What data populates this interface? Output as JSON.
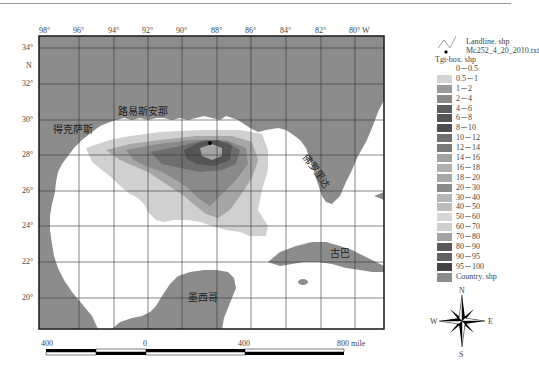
{
  "map": {
    "top_ticks": [
      "98°",
      "96°",
      "94°",
      "92°",
      "90°",
      "88°",
      "86°",
      "84°",
      "82°",
      "80° W"
    ],
    "left_ticks": [
      "34°",
      "N",
      "32°",
      "30°",
      "28°",
      "26°",
      "24°",
      "22°",
      "20°"
    ],
    "place_labels": {
      "louisiana": "路易斯安那",
      "texas": "得克萨斯",
      "florida": "佛罗里达",
      "cuba": "古巴",
      "mexico": "墨西哥"
    },
    "colors": {
      "land": "#8c8c8c",
      "water": "#ffffff",
      "frame": "#222222",
      "grid": "#333333"
    }
  },
  "legend": {
    "landline": "Landline. shp",
    "source_point": "Mc252_4_20_2010.txt",
    "tgt_box_title": "Tgt-box. shp",
    "classes": [
      {
        "label": "0－0.5",
        "color": "#ffffff"
      },
      {
        "label": "0.5－1",
        "color": "#d4d4d4"
      },
      {
        "label": "1－2",
        "color": "#9a9a9a"
      },
      {
        "label": "2－4",
        "color": "#8a8a8a"
      },
      {
        "label": "4－6",
        "color": "#5c5c5c"
      },
      {
        "label": "6－8",
        "color": "#555555"
      },
      {
        "label": "8－10",
        "color": "#4e4e4e"
      },
      {
        "label": "10－12",
        "color": "#707070"
      },
      {
        "label": "12－14",
        "color": "#7a7a7a"
      },
      {
        "label": "14－16",
        "color": "#a2a2a2"
      },
      {
        "label": "16－18",
        "color": "#b0b0b0"
      },
      {
        "label": "18－20",
        "color": "#a8a8a8"
      },
      {
        "label": "20－30",
        "color": "#8a8a8a"
      },
      {
        "label": "30－40",
        "color": "#b6b6b6"
      },
      {
        "label": "40－50",
        "color": "#bcbcbc"
      },
      {
        "label": "50－60",
        "color": "#d6d6d6"
      },
      {
        "label": "60－70",
        "color": "#cfcfcf"
      },
      {
        "label": "70－80",
        "color": "#a4a4a4"
      },
      {
        "label": "80－90",
        "color": "#5a5a5a"
      },
      {
        "label": "90－95",
        "color": "#626262"
      },
      {
        "label": "95－100",
        "color": "#444444"
      }
    ],
    "country": {
      "label": "Country. shp",
      "color": "#8c8c8c"
    }
  },
  "scale_bar": {
    "labels": [
      "400",
      "0",
      "400",
      "800  mile"
    ]
  },
  "north_arrow": {
    "n": "N",
    "s": "S",
    "e": "E",
    "w": "W"
  }
}
